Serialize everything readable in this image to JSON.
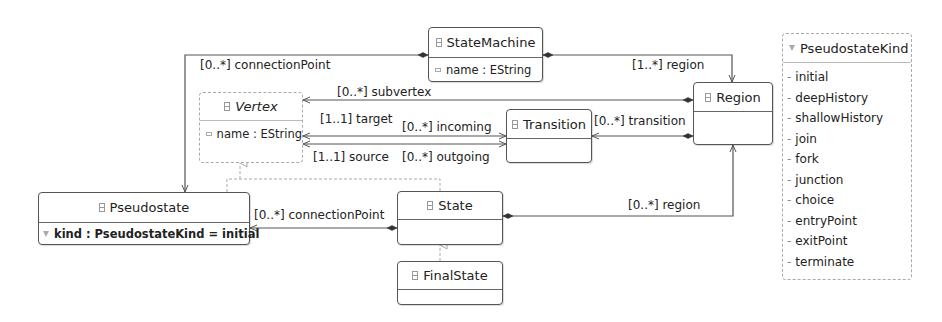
{
  "classes": {
    "state_machine": {
      "name": "StateMachine",
      "attributes": [
        "name : EString"
      ]
    },
    "vertex": {
      "name": "Vertex",
      "abstract": true,
      "attributes": [
        "name : EString"
      ]
    },
    "transition": {
      "name": "Transition",
      "attributes": []
    },
    "region": {
      "name": "Region",
      "attributes": []
    },
    "pseudostate": {
      "name": "Pseudostate",
      "attributes": [
        "kind : PseudostateKind = initial"
      ]
    },
    "state": {
      "name": "State",
      "attributes": []
    },
    "final_state": {
      "name": "FinalState",
      "attributes": []
    }
  },
  "enumeration": {
    "name": "PseudostateKind",
    "literals": [
      "initial",
      "deepHistory",
      "shallowHistory",
      "join",
      "fork",
      "junction",
      "choice",
      "entryPoint",
      "exitPoint",
      "terminate"
    ],
    "literal_prefix": "-"
  },
  "associations": {
    "sm_connection_point": "[0..*] connectionPoint",
    "sm_region": "[1..*] region",
    "region_subvertex": "[0..*] subvertex",
    "region_transition": "[0..*] transition",
    "transition_target": "[1..1] target",
    "vertex_incoming": "[0..*] incoming",
    "transition_source": "[1..1] source",
    "vertex_outgoing": "[0..*] outgoing",
    "state_connection_point": "[0..*] connectionPoint",
    "state_region": "[0..*] region"
  },
  "colors": {
    "line": "#555555",
    "abstract_border": "#aaaaaa",
    "background": "#ffffff"
  }
}
